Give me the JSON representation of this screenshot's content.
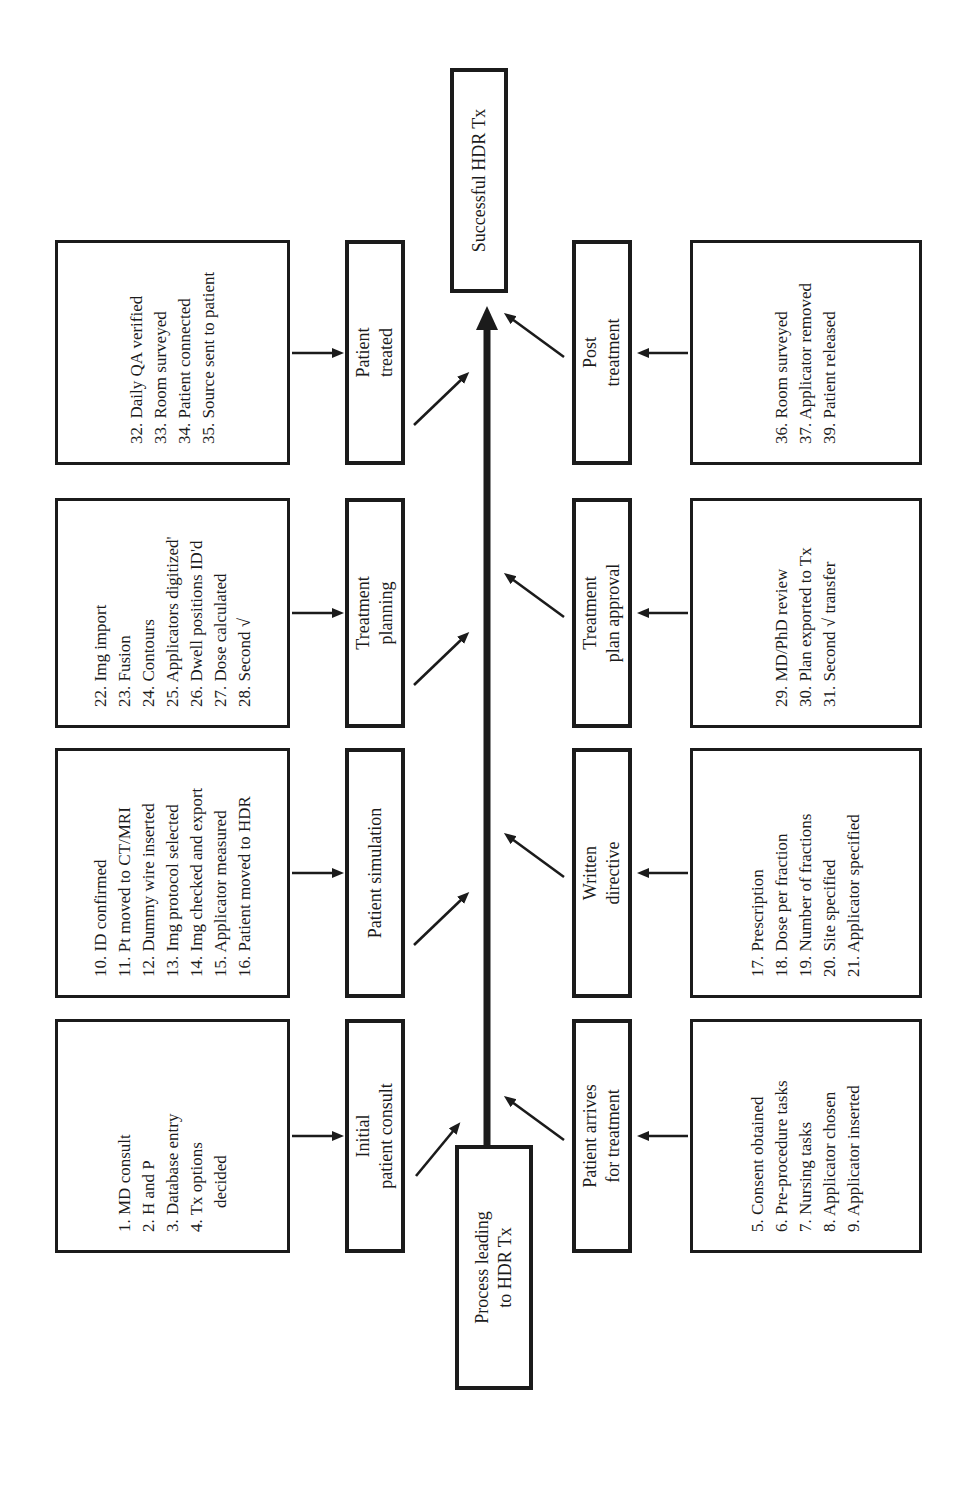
{
  "colors": {
    "ink": "#1b1b1b",
    "background": "#ffffff"
  },
  "start": {
    "label": "Process leading\nto HDR Tx"
  },
  "end": {
    "label": "Successful HDR Tx"
  },
  "top": [
    {
      "label": "Initial\npatient consult",
      "items": [
        "1. MD consult",
        "2. H and P",
        "3. Database entry",
        "4. Tx options\ndecided"
      ]
    },
    {
      "label": "Patient simulation",
      "items": [
        "10. ID confirmed",
        "11. Pt moved to CT/MRI",
        "12. Dummy wire inserted",
        "13. Img protocol selected",
        "14. Img checked and export",
        "15. Applicator measured",
        "16. Patient moved to HDR"
      ]
    },
    {
      "label": "Treatment\nplanning",
      "items": [
        "22. Img import",
        "23. Fusion",
        "24. Contours",
        "25. Applicators digitized'",
        "26. Dwell positions ID'd",
        "27. Dose calculated",
        "28. Second √"
      ]
    },
    {
      "label": "Patient\ntreated",
      "items": [
        "32. Daily QA verified",
        "33. Room surveyed",
        "34. Patient connected",
        "35. Source sent to patient"
      ]
    }
  ],
  "bottom": [
    {
      "label": "Patient arrives\nfor treatment",
      "items": [
        "5. Consent obtained",
        "6. Pre-procedure tasks",
        "7. Nursing tasks",
        "8. Applicator chosen",
        "9. Applicator inserted"
      ]
    },
    {
      "label": "Written\ndirective",
      "items": [
        "17. Prescription",
        "18. Dose per fraction",
        "19. Number of fractions",
        "20. Site specified",
        "21. Applicator specified"
      ]
    },
    {
      "label": "Treatment\nplan approval",
      "items": [
        "29. MD/PhD review",
        "30. Plan exported to Tx",
        "31. Second √ transfer"
      ]
    },
    {
      "label": "Post\ntreatment",
      "items": [
        "36. Room surveyed",
        "37. Applicator removed",
        "39. Patient released"
      ]
    }
  ]
}
